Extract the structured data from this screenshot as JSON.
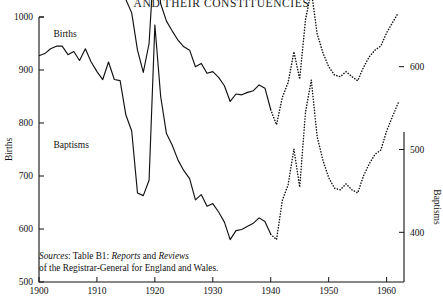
{
  "header": {
    "title": "AND THEIR CONSTITUENCIES"
  },
  "axes": {
    "left": {
      "name": "Births",
      "ticks": [
        1000,
        900,
        800,
        700,
        600,
        500
      ],
      "min": 500,
      "max": 1000
    },
    "right": {
      "name": "Baptisms",
      "ticks": [
        600,
        500,
        400
      ],
      "min": 340,
      "max": 660
    },
    "x": {
      "ticks": [
        1900,
        1910,
        1920,
        1930,
        1940,
        1950,
        1960
      ],
      "min": 1900,
      "max": 1963
    }
  },
  "source_note": {
    "lead": "Sources",
    "line1_a": ": Table B1: ",
    "line1_italic1": "Reports",
    "line1_b": " and ",
    "line1_italic2": "Reviews",
    "line2": "of the Registrar-General for England and Wales."
  },
  "chart_data": {
    "type": "line",
    "title": "AND THEIR CONSTITUENCIES",
    "xlabel": "",
    "ylabel": "Births",
    "y2label": "Baptisms",
    "xlim": [
      1900,
      1963
    ],
    "ylim": [
      500,
      1000
    ],
    "y2lim": [
      340,
      660
    ],
    "grid": false,
    "legend": "inline-labels",
    "annotations": [
      {
        "text": "Births",
        "x": 1902.5,
        "y": 962
      },
      {
        "text": "Baptisms",
        "x": 1902.5,
        "y": 752
      }
    ],
    "series": [
      {
        "name": "Births",
        "axis": "left",
        "style_solid_until": 1940,
        "style_dotted_from": 1941,
        "x": [
          1900,
          1901,
          1902,
          1903,
          1904,
          1905,
          1906,
          1907,
          1908,
          1909,
          1910,
          1911,
          1912,
          1913,
          1914,
          1915,
          1916,
          1917,
          1918,
          1919,
          1920,
          1921,
          1922,
          1923,
          1924,
          1925,
          1926,
          1927,
          1928,
          1929,
          1930,
          1931,
          1932,
          1933,
          1934,
          1935,
          1936,
          1937,
          1938,
          1939,
          1940,
          1941,
          1942,
          1943,
          1944,
          1945,
          1946,
          1947,
          1948,
          1949,
          1950,
          1951,
          1952,
          1953,
          1954,
          1955,
          1956,
          1957,
          1958,
          1959,
          1960,
          1961,
          1962
        ],
        "values": [
          927,
          931,
          940,
          945,
          945,
          929,
          935,
          918,
          940,
          915,
          897,
          882,
          915,
          882,
          880,
          815,
          785,
          668,
          663,
          692,
          985,
          850,
          780,
          758,
          730,
          710,
          695,
          655,
          665,
          643,
          648,
          632,
          613,
          580,
          597,
          599,
          605,
          611,
          621,
          614,
          590,
          580,
          654,
          684,
          751,
          679,
          821,
          881,
          775,
          730,
          697,
          677,
          674,
          685,
          674,
          668,
          700,
          723,
          741,
          749,
          785,
          812,
          838
        ]
      },
      {
        "name": "Baptisms",
        "axis": "right",
        "style_solid_until": 1940,
        "style_dotted_from": 1941,
        "x": [
          1900,
          1901,
          1902,
          1903,
          1904,
          1905,
          1906,
          1907,
          1908,
          1909,
          1910,
          1911,
          1912,
          1913,
          1914,
          1915,
          1916,
          1917,
          1918,
          1919,
          1920,
          1921,
          1922,
          1923,
          1924,
          1925,
          1926,
          1927,
          1928,
          1929,
          1930,
          1931,
          1932,
          1933,
          1934,
          1935,
          1936,
          1937,
          1938,
          1939,
          1940,
          1941,
          1942,
          1943,
          1944,
          1945,
          1946,
          1947,
          1948,
          1949,
          1950,
          1951,
          1952,
          1953,
          1954,
          1955,
          1956,
          1957,
          1958,
          1959,
          1960,
          1961,
          1962
        ],
        "values": [
          713,
          718,
          726,
          740,
          733,
          726,
          733,
          726,
          737,
          724,
          716,
          711,
          722,
          703,
          707,
          681,
          665,
          620,
          593,
          628,
          745,
          676,
          655,
          643,
          632,
          624,
          620,
          600,
          604,
          592,
          594,
          587,
          577,
          558,
          567,
          566,
          569,
          571,
          578,
          574,
          548,
          530,
          563,
          581,
          618,
          585,
          657,
          692,
          640,
          617,
          600,
          590,
          588,
          594,
          588,
          583,
          599,
          612,
          620,
          625,
          641,
          653,
          665
        ]
      }
    ]
  }
}
